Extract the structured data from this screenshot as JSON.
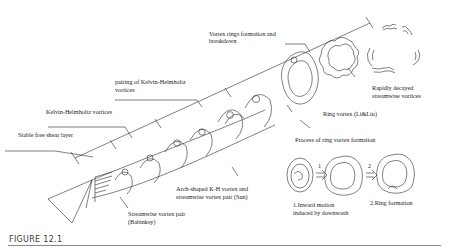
{
  "figure": {
    "caption": "FIGURE 12.1",
    "labels": {
      "vortex_rings": "Vortex rings formation and",
      "vortex_rings_2": "breakdown",
      "pairing": "pairing of Kelvin-Helmholtz",
      "pairing_2": "vortices",
      "kh": "Kelvin-Helmholtz vortices",
      "shear": "Stable free shear layer",
      "decayed": "Rapidly decayed",
      "decayed_2": "streamwise vortices",
      "ring_vortex": "Ring vortex (Li&Liu)",
      "process": "Process of ring vortex formation",
      "arch": "Arch-shaped K-H vortex and",
      "arch_2": "streamwise vortex pair (Sun)",
      "streamwise": "Streamwise vortex pair",
      "streamwise_2": "(Babinksy)",
      "step1_num": "1",
      "step2_num": "2",
      "step1": "1.Inward motion",
      "step1_2": "induced by downwash",
      "step2": "2.Ring formation"
    },
    "colors": {
      "line": "#2a2a2a",
      "caption": "#3a3a3a",
      "rule": "#888888"
    }
  }
}
